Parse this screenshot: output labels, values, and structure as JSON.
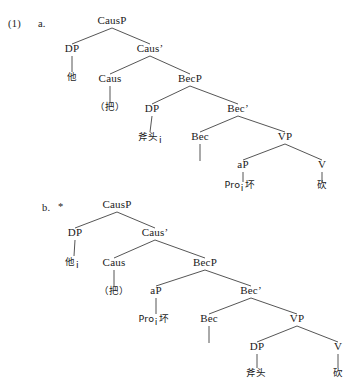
{
  "page": {
    "example_number": "(1)",
    "background_color": "#ffffff",
    "text_color": "#1a1a1a"
  },
  "trees": [
    {
      "id": "tree-a",
      "label": "a.",
      "grammaticality": "",
      "nodes": [
        {
          "name": "causp",
          "text": "CausP",
          "x": 112,
          "y": 24,
          "type": "label"
        },
        {
          "name": "dp-subject",
          "text": "DP",
          "x": 72,
          "y": 52,
          "type": "label"
        },
        {
          "name": "caus-bar",
          "text": "Caus’",
          "x": 150,
          "y": 52,
          "type": "label"
        },
        {
          "name": "ta",
          "text": "他",
          "x": 72,
          "y": 80,
          "type": "word"
        },
        {
          "name": "caus-head",
          "text": "Caus",
          "x": 110,
          "y": 82,
          "type": "label"
        },
        {
          "name": "becp",
          "text": "BecP",
          "x": 190,
          "y": 82,
          "type": "label"
        },
        {
          "name": "ba",
          "text": "（把）",
          "x": 110,
          "y": 110,
          "type": "word"
        },
        {
          "name": "dp-object",
          "text": "DP",
          "x": 152,
          "y": 112,
          "type": "label"
        },
        {
          "name": "bec-bar",
          "text": "Bec’",
          "x": 238,
          "y": 112,
          "type": "label"
        },
        {
          "name": "futou",
          "text": "斧头",
          "x": 150,
          "y": 140,
          "type": "word",
          "subscript": "i"
        },
        {
          "name": "bec-head",
          "text": "Bec",
          "x": 200,
          "y": 140,
          "type": "label"
        },
        {
          "name": "vp",
          "text": "VP",
          "x": 285,
          "y": 140,
          "type": "label"
        },
        {
          "name": "ap",
          "text": "aP",
          "x": 243,
          "y": 168,
          "type": "label"
        },
        {
          "name": "v-head",
          "text": "V",
          "x": 322,
          "y": 168,
          "type": "label"
        },
        {
          "name": "pro-huai",
          "text": "Pro",
          "x": 240,
          "y": 188,
          "type": "word",
          "subscript": "i",
          "suffix": "坏"
        },
        {
          "name": "kan",
          "text": "砍",
          "x": 322,
          "y": 188,
          "type": "word"
        }
      ],
      "branches": [
        [
          112,
          28,
          72,
          44
        ],
        [
          112,
          28,
          150,
          44
        ],
        [
          72,
          56,
          72,
          72
        ],
        [
          150,
          56,
          110,
          74
        ],
        [
          150,
          56,
          190,
          74
        ],
        [
          110,
          86,
          110,
          102
        ],
        [
          190,
          86,
          152,
          104
        ],
        [
          190,
          86,
          238,
          104
        ],
        [
          152,
          116,
          150,
          132
        ],
        [
          238,
          116,
          200,
          132
        ],
        [
          238,
          116,
          285,
          132
        ],
        [
          200,
          144,
          200,
          161
        ],
        [
          285,
          144,
          243,
          160
        ],
        [
          285,
          144,
          322,
          160
        ],
        [
          243,
          172,
          243,
          182
        ],
        [
          322,
          172,
          322,
          182
        ]
      ]
    },
    {
      "id": "tree-b",
      "label": "b.",
      "grammaticality": "*",
      "nodes": [
        {
          "name": "causp",
          "text": "CausP",
          "x": 117,
          "y": 208,
          "type": "label"
        },
        {
          "name": "dp-subject",
          "text": "DP",
          "x": 75,
          "y": 236,
          "type": "label"
        },
        {
          "name": "caus-bar",
          "text": "Caus’",
          "x": 155,
          "y": 236,
          "type": "label"
        },
        {
          "name": "ta",
          "text": "他",
          "x": 72,
          "y": 265,
          "type": "word",
          "subscript": "i"
        },
        {
          "name": "caus-head",
          "text": "Caus",
          "x": 114,
          "y": 266,
          "type": "label"
        },
        {
          "name": "becp",
          "text": "BecP",
          "x": 205,
          "y": 266,
          "type": "label"
        },
        {
          "name": "ba",
          "text": "（把）",
          "x": 114,
          "y": 294,
          "type": "word"
        },
        {
          "name": "ap",
          "text": "aP",
          "x": 156,
          "y": 294,
          "type": "label"
        },
        {
          "name": "bec-bar",
          "text": "Bec’",
          "x": 251,
          "y": 294,
          "type": "label"
        },
        {
          "name": "pro-huai",
          "text": "Pro",
          "x": 154,
          "y": 322,
          "type": "word",
          "subscript": "i",
          "suffix": "坏"
        },
        {
          "name": "bec-head",
          "text": "Bec",
          "x": 209,
          "y": 322,
          "type": "label"
        },
        {
          "name": "vp",
          "text": "VP",
          "x": 297,
          "y": 322,
          "type": "label"
        },
        {
          "name": "dp-object",
          "text": "DP",
          "x": 257,
          "y": 350,
          "type": "label"
        },
        {
          "name": "v-head",
          "text": "V",
          "x": 338,
          "y": 350,
          "type": "label"
        },
        {
          "name": "futou",
          "text": "斧头",
          "x": 256,
          "y": 376,
          "type": "word"
        },
        {
          "name": "kan",
          "text": "砍",
          "x": 338,
          "y": 376,
          "type": "word"
        }
      ],
      "branches": [
        [
          117,
          212,
          75,
          228
        ],
        [
          117,
          212,
          155,
          228
        ],
        [
          75,
          240,
          74,
          256
        ],
        [
          155,
          240,
          114,
          258
        ],
        [
          155,
          240,
          205,
          258
        ],
        [
          114,
          270,
          114,
          286
        ],
        [
          205,
          270,
          156,
          286
        ],
        [
          205,
          270,
          251,
          286
        ],
        [
          156,
          298,
          156,
          314
        ],
        [
          251,
          298,
          209,
          314
        ],
        [
          251,
          298,
          297,
          314
        ],
        [
          209,
          326,
          209,
          343
        ],
        [
          297,
          326,
          257,
          342
        ],
        [
          297,
          326,
          338,
          342
        ],
        [
          257,
          354,
          257,
          368
        ],
        [
          338,
          354,
          338,
          368
        ]
      ]
    }
  ]
}
